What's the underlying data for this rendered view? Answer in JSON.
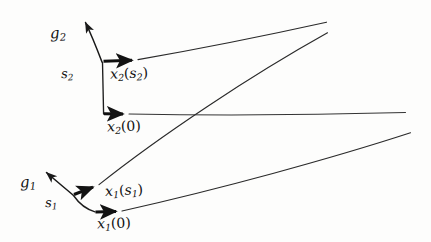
{
  "figure": {
    "background_color": "#fdfdfc",
    "ink_color": "#1a1a1a",
    "labels": {
      "g2": "g",
      "g2_sub": "2",
      "s2": "s",
      "s2_sub": "2",
      "x2_s2_base": "x",
      "x2_s2_sub": "2",
      "x2_s2_arg_open": "(",
      "x2_s2_arg": "s",
      "x2_s2_arg_sub": "2",
      "x2_s2_arg_close": ")",
      "x2_0_base": "x",
      "x2_0_sub": "2",
      "x2_0_arg": "(0)",
      "g1": "g",
      "g1_sub": "1",
      "s1": "s",
      "s1_sub": "1",
      "x1_s1_base": "x",
      "x1_s1_sub": "1",
      "x1_s1_arg_open": "(",
      "x1_s1_arg": "s",
      "x1_s1_arg_sub": "1",
      "x1_s1_arg_close": ")",
      "x1_0_base": "x",
      "x1_0_sub": "1",
      "x1_0_arg": "(0)"
    },
    "geometry": {
      "upper_frame": {
        "vertex_s2": [
          102,
          62
        ],
        "gradient_tip_g2": [
          84,
          20
        ],
        "vertical_foot": [
          104,
          114
        ],
        "x2_s2_arrow_tip": [
          138,
          61
        ],
        "x2_0_arrow_tip": [
          129,
          114
        ]
      },
      "lower_frame": {
        "vertex_s1": [
          73,
          195
        ],
        "gradient_tip_g1": [
          45,
          171
        ],
        "curve_foot": [
          95,
          212
        ],
        "x1_s1_arrow_tip": [
          98,
          185
        ],
        "x1_0_arrow_tip": [
          122,
          212
        ]
      },
      "rays": {
        "ray_from_x2_s2_to": [
          327,
          22
        ],
        "ray_from_x2_0_to": [
          406,
          113
        ],
        "ray_from_x1_s1_to": [
          328,
          33
        ],
        "ray_from_x1_0_to": [
          411,
          133
        ]
      }
    }
  }
}
